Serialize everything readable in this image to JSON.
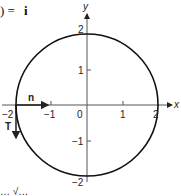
{
  "equation": {
    "left": ") = ",
    "right": "i"
  },
  "axes": {
    "x_label": "x",
    "y_label": "y"
  },
  "x_ticks": [
    "−2",
    "−1",
    "0",
    "1",
    "2"
  ],
  "y_ticks": [
    "2",
    "1",
    "−1",
    "−2"
  ],
  "vectors": {
    "normal": "n",
    "tangent": "T"
  },
  "caption_fragment": "… √…"
}
